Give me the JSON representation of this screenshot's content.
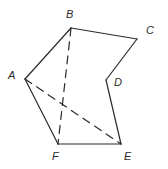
{
  "diagram": {
    "type": "geometric-figure",
    "vertices": [
      {
        "id": "A",
        "label": "A"
      },
      {
        "id": "B",
        "label": "B"
      },
      {
        "id": "C",
        "label": "C"
      },
      {
        "id": "D",
        "label": "D"
      },
      {
        "id": "E",
        "label": "E"
      },
      {
        "id": "F",
        "label": "F"
      }
    ],
    "edges": [
      {
        "from": "A",
        "to": "B",
        "style": "solid"
      },
      {
        "from": "B",
        "to": "C",
        "style": "solid"
      },
      {
        "from": "C",
        "to": "D",
        "style": "solid"
      },
      {
        "from": "D",
        "to": "E",
        "style": "solid"
      },
      {
        "from": "E",
        "to": "F",
        "style": "solid"
      },
      {
        "from": "F",
        "to": "A",
        "style": "solid"
      },
      {
        "from": "B",
        "to": "F",
        "style": "dashed"
      },
      {
        "from": "A",
        "to": "E",
        "style": "dashed"
      }
    ],
    "line_color": "#2a2a2a",
    "background": "#ffffff"
  }
}
